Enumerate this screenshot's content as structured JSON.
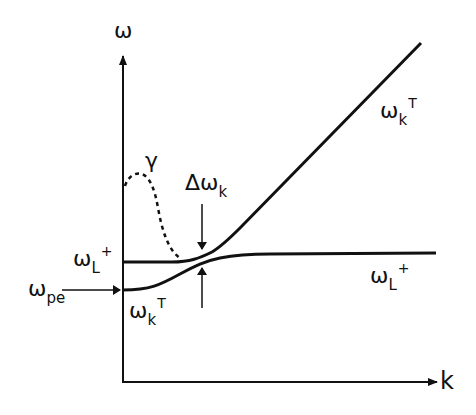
{
  "diagram": {
    "type": "dispersion-relation",
    "axes": {
      "y_label": "ω",
      "x_label": "k"
    },
    "labels": {
      "gamma": "γ",
      "delta_omega": {
        "main": "Δω",
        "sub": "k"
      },
      "omega_L_plus_left": {
        "main": "ω",
        "sub": "L",
        "sup": "+"
      },
      "omega_pe": {
        "main": "ω",
        "sub": "pe"
      },
      "omega_kT_left": {
        "main": "ω",
        "sub": "k",
        "sup": "T"
      },
      "omega_kT_right": {
        "main": "ω",
        "sub": "k",
        "sup": "T"
      },
      "omega_L_plus_right": {
        "main": "ω",
        "sub": "L",
        "sup": "+"
      }
    },
    "curves": [
      {
        "name": "upper-branch",
        "description": "flat at ω_L+ then rising linearly as transverse mode ω_k^T",
        "style": "solid"
      },
      {
        "name": "lower-branch",
        "description": "starts at ω_pe, rises and saturates at ω_L+",
        "style": "solid"
      },
      {
        "name": "gamma-damping",
        "description": "damping rate γ peaked near k=0, decaying to zero",
        "style": "dashed"
      }
    ],
    "annotations": [
      {
        "name": "gap-arrows",
        "description": "opposing arrows marking the splitting Δω_k at the avoided crossing"
      },
      {
        "name": "omega-pe-arrow",
        "description": "horizontal arrow pointing to ω_pe on the ω axis"
      }
    ],
    "colors": {
      "ink": "#111111",
      "background": "#ffffff"
    }
  }
}
